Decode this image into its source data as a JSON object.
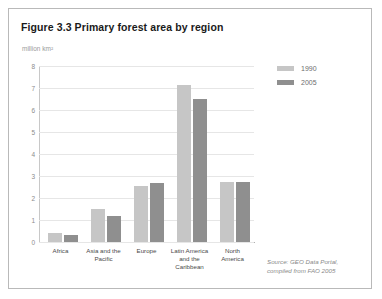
{
  "figure": {
    "title": "Figure 3.3 Primary forest area by region",
    "unit_label": "million km²",
    "source_line_1": "Source: GEO Data Portal,",
    "source_line_2": "compiled from FAO 2005"
  },
  "legend": {
    "position": "right",
    "entries": [
      {
        "label": "1990",
        "color": "#c6c6c6"
      },
      {
        "label": "2005",
        "color": "#8f8f8f"
      }
    ]
  },
  "chart_data": {
    "type": "bar",
    "title": "Figure 3.3 Primary forest area by region",
    "subtitle": "million km²",
    "xlabel": "",
    "ylabel": "million km²",
    "ylim": [
      0,
      8
    ],
    "ytick_labels": [
      "0",
      "1",
      "2",
      "3",
      "4",
      "5",
      "6",
      "7",
      "8"
    ],
    "ytick_values": [
      0,
      1,
      2,
      3,
      4,
      5,
      6,
      7,
      8
    ],
    "grid": true,
    "legend_position": "right",
    "categories": [
      "Africa",
      "Asia and the Pacific",
      "Europe",
      "Latin America and the Caribbean",
      "North America"
    ],
    "category_lines": [
      [
        "Africa"
      ],
      [
        "Asia and the",
        "Pacific"
      ],
      [
        "Europe"
      ],
      [
        "Latin America",
        "and the",
        "Caribbean"
      ],
      [
        "North",
        "America"
      ]
    ],
    "series": [
      {
        "name": "1990",
        "color": "#c6c6c6",
        "values": [
          0.4,
          1.5,
          2.55,
          7.15,
          2.75
        ]
      },
      {
        "name": "2005",
        "color": "#8f8f8f",
        "values": [
          0.3,
          1.2,
          2.7,
          6.5,
          2.75
        ]
      }
    ],
    "annotations": [
      "Source: GEO Data Portal, compiled from FAO 2005"
    ]
  }
}
